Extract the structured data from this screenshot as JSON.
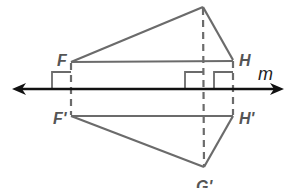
{
  "diagram": {
    "type": "reflection across line",
    "line": {
      "label": "m"
    },
    "original": {
      "vertices": [
        {
          "label": "F"
        },
        {
          "label": "G"
        },
        {
          "label": "H"
        }
      ]
    },
    "image": {
      "vertices": [
        {
          "label": "F'"
        },
        {
          "label": "G'"
        },
        {
          "label": "H'"
        }
      ]
    },
    "colors": {
      "figure": "#6b6b6b",
      "line": "#111111"
    }
  }
}
